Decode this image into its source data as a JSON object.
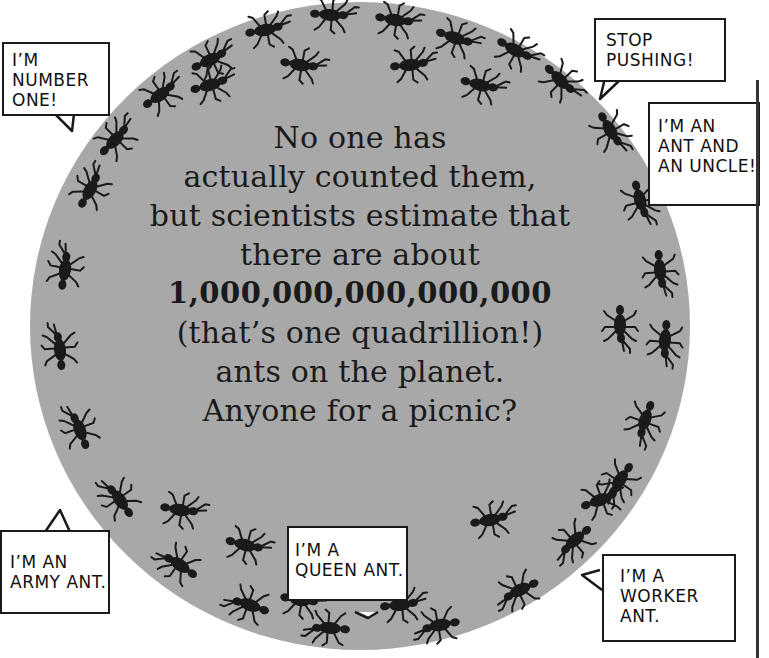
{
  "illustration": {
    "subject": "ants covering a globe",
    "globe_color": "#a8a8a8",
    "ink_color": "#1a1a1a"
  },
  "main_text": {
    "lines": [
      "No one has",
      "actually counted them,",
      "but scientists estimate that",
      "there are about",
      "1,000,000,000,000,000",
      "(that’s one quadrillion!)",
      "ants on the planet.",
      "Anyone for a picnic?"
    ]
  },
  "speech_bubbles": [
    {
      "id": "number-one",
      "lines": [
        "I’M",
        "NUMBER",
        "ONE!"
      ]
    },
    {
      "id": "stop-pushing",
      "lines": [
        "STOP",
        "PUSHING!"
      ]
    },
    {
      "id": "ant-and-uncle",
      "lines": [
        "I’M AN",
        "ANT AND",
        "AN UNCLE!"
      ]
    },
    {
      "id": "army-ant",
      "lines": [
        "I’M AN",
        "ARMY ANT."
      ]
    },
    {
      "id": "queen-ant",
      "lines": [
        "I’M A",
        "QUEEN ANT."
      ]
    },
    {
      "id": "worker-ant",
      "lines": [
        "I’M A",
        "WORKER",
        "ANT."
      ]
    }
  ]
}
